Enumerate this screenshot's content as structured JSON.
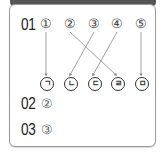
{
  "questions": [
    {
      "number": "01",
      "top_items": [
        "①",
        "②",
        "③",
        "④",
        "⑤"
      ],
      "bottom_items": [
        "ㄱ",
        "ㄴ",
        "ㄷ",
        "ㄹ",
        "ㅁ"
      ],
      "matches": [
        {
          "from": "①",
          "to": "ㄱ"
        },
        {
          "from": "②",
          "to": "ㄹ"
        },
        {
          "from": "③",
          "to": "ㄴ"
        },
        {
          "from": "④",
          "to": "ㄷ"
        },
        {
          "from": "⑤",
          "to": "ㅁ"
        }
      ]
    },
    {
      "number": "02",
      "answer": "②"
    },
    {
      "number": "03",
      "answer": "③"
    }
  ],
  "colors": {
    "line": "#888888",
    "border": "#9a9a9a",
    "header": "#555555"
  }
}
